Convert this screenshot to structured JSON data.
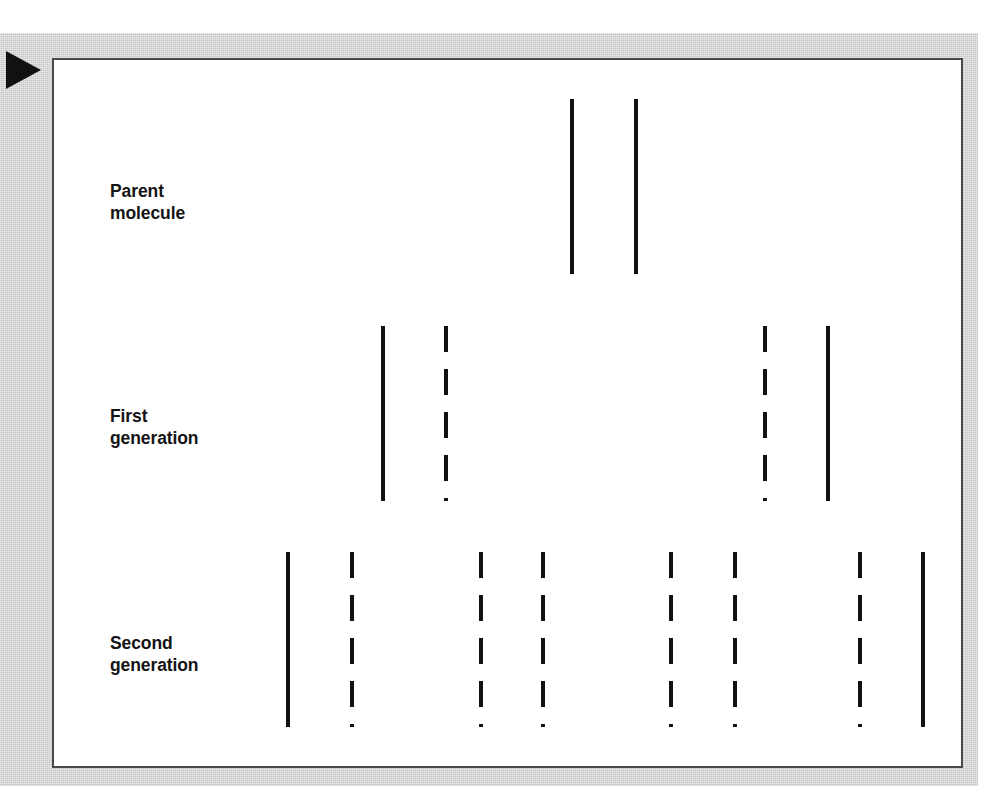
{
  "figure": {
    "marker_icon": "play-triangle-icon",
    "background_color": "#ffffff",
    "mat_color": "#c8c8c8",
    "plate_border_color": "#4a4a4a",
    "strand_color": "#121212",
    "rows": [
      {
        "id": "parent",
        "label": "Parent\nmolecule",
        "label_x": 108,
        "label_y": 178,
        "strand_top": 97,
        "strand_bottom": 272,
        "strands": [
          {
            "x": 568,
            "style": "solid"
          },
          {
            "x": 632,
            "style": "solid"
          }
        ]
      },
      {
        "id": "first-generation",
        "label": "First\ngeneration",
        "label_x": 108,
        "label_y": 403,
        "strand_top": 324,
        "strand_bottom": 499,
        "strands": [
          {
            "x": 379,
            "style": "solid"
          },
          {
            "x": 442,
            "style": "dashed"
          },
          {
            "x": 761,
            "style": "dashed"
          },
          {
            "x": 824,
            "style": "solid"
          }
        ]
      },
      {
        "id": "second-generation",
        "label": "Second\ngeneration",
        "label_x": 108,
        "label_y": 630,
        "strand_top": 550,
        "strand_bottom": 725,
        "strands": [
          {
            "x": 284,
            "style": "solid"
          },
          {
            "x": 348,
            "style": "dashed"
          },
          {
            "x": 477,
            "style": "dashed"
          },
          {
            "x": 539,
            "style": "dashed"
          },
          {
            "x": 667,
            "style": "dashed"
          },
          {
            "x": 731,
            "style": "dashed"
          },
          {
            "x": 856,
            "style": "dashed"
          },
          {
            "x": 919,
            "style": "solid"
          }
        ]
      }
    ],
    "legend_note": {
      "solid_meaning": "original parental strand",
      "dashed_meaning": "newly synthesized strand"
    }
  }
}
